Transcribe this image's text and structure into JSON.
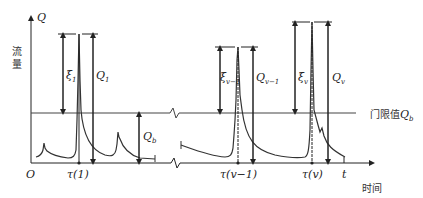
{
  "axes": {
    "y_label": "Q",
    "y_title": "流量",
    "x_label": "t",
    "x_title": "时间",
    "origin": "O"
  },
  "threshold": {
    "label_prefix": "门限值",
    "label_symbol": "Q",
    "label_sub": "b"
  },
  "base_flow": {
    "symbol": "Q",
    "sub": "b"
  },
  "peaks": [
    {
      "tick_label": "τ(1)",
      "xi_symbol": "ξ",
      "xi_sub": "1",
      "q_symbol": "Q",
      "q_sub": "1"
    },
    {
      "tick_label": "τ(v−1)",
      "xi_symbol": "ξ",
      "xi_sub": "v−1",
      "q_symbol": "Q",
      "q_sub": "v−1"
    },
    {
      "tick_label": "τ(v)",
      "xi_symbol": "ξ",
      "xi_sub": "v",
      "q_symbol": "Q",
      "q_sub": "v"
    }
  ],
  "colors": {
    "line": "#333333",
    "background": "#ffffff"
  }
}
